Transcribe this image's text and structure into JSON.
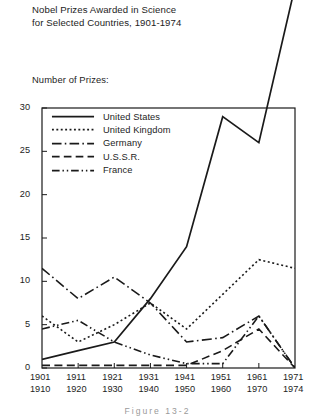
{
  "title": {
    "line1": "Nobel Prizes Awarded in Science",
    "line2": "for Selected Countries, 1901-1974"
  },
  "axis": {
    "y_label": "Number of Prizes:",
    "y_ticks": [
      "30",
      "25",
      "20",
      "15",
      "10",
      "5",
      "0"
    ],
    "x_ticks": [
      {
        "top": "1901",
        "bottom": "1910"
      },
      {
        "top": "1911",
        "bottom": "1920"
      },
      {
        "top": "1921",
        "bottom": "1930"
      },
      {
        "top": "1931",
        "bottom": "1940"
      },
      {
        "top": "1941",
        "bottom": "1950"
      },
      {
        "top": "1951",
        "bottom": "1960"
      },
      {
        "top": "1961",
        "bottom": "1970"
      },
      {
        "top": "1971",
        "bottom": "1974"
      }
    ]
  },
  "legend": {
    "items": [
      {
        "label": "United States",
        "key": "solid"
      },
      {
        "label": "United Kingdom",
        "key": "dotted"
      },
      {
        "label": "Germany",
        "key": "dash-dot"
      },
      {
        "label": "U.S.S.R.",
        "key": "dashed"
      },
      {
        "label": "France",
        "key": "dash-dot-dot"
      }
    ]
  },
  "caption": "Figure 13-2",
  "colors": {
    "ink": "#1a1a1a",
    "frame": "#1a1a1a",
    "background": "#ffffff"
  },
  "chart_data": {
    "type": "line",
    "title": "Nobel Prizes Awarded in Science for Selected Countries, 1901-1974",
    "xlabel": "",
    "ylabel": "Number of Prizes:",
    "ylim": [
      0,
      30
    ],
    "yticks": [
      0,
      5,
      10,
      15,
      20,
      25,
      30
    ],
    "grid": false,
    "legend_position": "inside-top-left",
    "note": "United States series rises above the plot frame in the final period and is drawn clipped beyond the top of the chart area.",
    "categories": [
      "1901-1910",
      "1911-1920",
      "1921-1930",
      "1931-1940",
      "1941-1950",
      "1951-1960",
      "1961-1970",
      "1971-1974"
    ],
    "series": [
      {
        "name": "United States",
        "style": "solid",
        "values": [
          1,
          2,
          3,
          8,
          14,
          29,
          26,
          44
        ]
      },
      {
        "name": "United Kingdom",
        "style": "dotted",
        "values": [
          6,
          3,
          5,
          7.5,
          4.5,
          8.5,
          12.5,
          11.5
        ]
      },
      {
        "name": "Germany",
        "style": "dash-dot",
        "values": [
          11.5,
          8,
          10.5,
          7.5,
          3,
          3.5,
          6,
          0
        ]
      },
      {
        "name": "U.S.S.R.",
        "style": "dashed",
        "values": [
          0.3,
          0.3,
          0.3,
          0.3,
          0.3,
          2,
          4.5,
          0
        ]
      },
      {
        "name": "France",
        "style": "dash-dot-dot",
        "values": [
          4.5,
          5.5,
          3,
          1.5,
          0.5,
          0.5,
          6,
          0
        ]
      }
    ]
  }
}
